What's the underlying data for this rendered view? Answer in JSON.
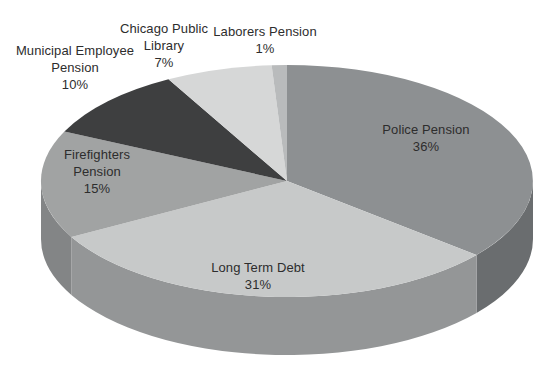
{
  "background": "#ffffff",
  "text_color": "#2d2d2d",
  "chart_data": {
    "type": "pie",
    "projection": "3d",
    "title": "",
    "legend": "none",
    "start_angle_deg": 90,
    "direction": "clockwise",
    "units": "percent",
    "slices": [
      {
        "label": "Police Pension",
        "value": 36,
        "pct_label": "36%",
        "color": "#8d9092",
        "side_color": "#6a6d6f",
        "label_placement": "inside"
      },
      {
        "label": "Long Term Debt",
        "value": 31,
        "pct_label": "31%",
        "color": "#c7c9c9",
        "side_color": "#949697",
        "label_placement": "inside"
      },
      {
        "label": "Firefighters Pension",
        "value": 15,
        "pct_label": "15%",
        "color": "#a1a3a3",
        "side_color": "#838586",
        "label_placement": "inside"
      },
      {
        "label": "Municipal Employee Pension",
        "value": 10,
        "pct_label": "10%",
        "color": "#3e3f40",
        "side_color": "#2e2f30",
        "label_placement": "outside"
      },
      {
        "label": "Chicago Public Library",
        "value": 7,
        "pct_label": "7%",
        "color": "#d6d7d7",
        "side_color": "#b0b1b1",
        "label_placement": "outside"
      },
      {
        "label": "Laborers Pension",
        "value": 1,
        "pct_label": "1%",
        "color": "#b9bbbc",
        "side_color": "#98999a",
        "label_placement": "outside"
      }
    ]
  }
}
